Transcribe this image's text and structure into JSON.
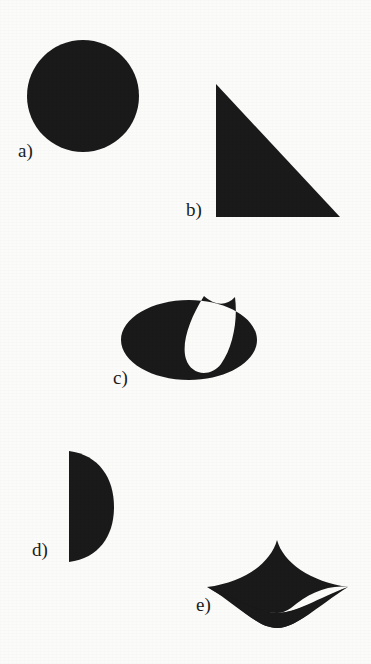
{
  "figure": {
    "width": 371,
    "height": 664,
    "background_color": "#fbfbfa",
    "ink_color": "#1a1a1a",
    "label_color": "#1c1c1c",
    "caption": ""
  },
  "shapes": [
    {
      "key": "a",
      "label": "a)",
      "name": "circle",
      "description": "solid filled circle (disc)",
      "label_x": 18,
      "label_y": 157,
      "geometry": {
        "type": "circle",
        "cx": 83,
        "cy": 96,
        "r": 56
      }
    },
    {
      "key": "b",
      "label": "b)",
      "name": "right-triangle",
      "description": "solid right triangle, right angle at bottom-left, apex at top-left",
      "label_x": 186,
      "label_y": 216,
      "geometry": {
        "type": "polygon",
        "points": "216,84 216,217 340,217"
      }
    },
    {
      "key": "c",
      "label": "c)",
      "name": "ellipse-with-teardrop-notch",
      "description": "solid ellipse with a white teardrop shaped notch cut out of the top, opening upward",
      "label_x": 113,
      "label_y": 384,
      "geometry": {
        "type": "ellipse-with-hole",
        "cx": 189,
        "cy": 340,
        "rx": 68,
        "ry": 40,
        "notch_path": "M 203 297 C 189 318 181 342 186 358 C 191 374 209 377 219 364 C 231 348 236 322 234 300 C 226 308 214 306 203 297 Z"
      }
    },
    {
      "key": "d",
      "label": "d)",
      "name": "half-disc",
      "description": "solid semicircle with flat vertical edge on the left, bulging to the right",
      "label_x": 32,
      "label_y": 556,
      "geometry": {
        "type": "half-disc",
        "flat_x": 69,
        "top_y": 451,
        "bottom_y": 562,
        "bulge_x": 114
      }
    },
    {
      "key": "e",
      "label": "e)",
      "name": "three-cusped-curved-triangle",
      "description": "solid shape with three sharp cusps (top, left, right) joined by concave arcs, like a curved sail",
      "label_x": 196,
      "label_y": 611,
      "geometry": {
        "type": "cusped-path",
        "cusp_top": [
          277,
          540
        ],
        "cusp_left": [
          207,
          587
        ],
        "cusp_right": [
          349,
          587
        ],
        "bottom_y": 628
      }
    }
  ]
}
